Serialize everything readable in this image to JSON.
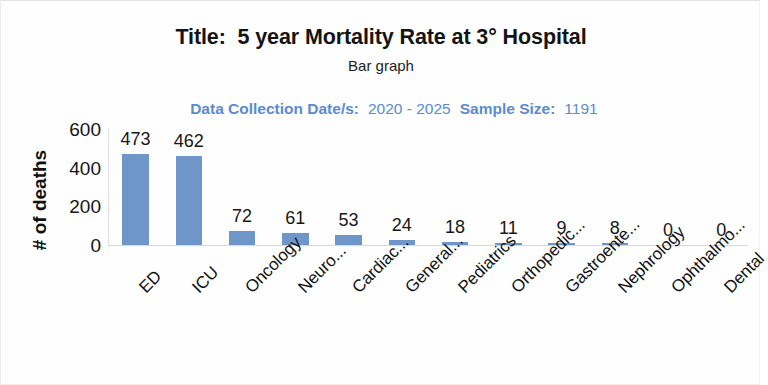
{
  "header": {
    "title": "Title:  5 year Mortality Rate at 3° Hospital",
    "subtitle": "Bar graph",
    "data_collection_label": "Data Collection Date/s:",
    "data_collection_value": "2020 - 2025",
    "sample_size_label": "Sample Size:",
    "sample_size_value": "1191",
    "meta_color": "#5b8bd0"
  },
  "chart_data": {
    "type": "bar",
    "title": "Title:  5 year Mortality Rate at 3° Hospital",
    "subtitle": "Bar graph",
    "xlabel": "",
    "ylabel": "# of deaths",
    "ylim": [
      0,
      600
    ],
    "yticks": [
      600,
      400,
      200,
      0
    ],
    "grid": false,
    "legend": false,
    "bar_color": "#6f96c8",
    "categories": [
      "ED",
      "ICU",
      "Oncology",
      "Neuro...",
      "Cardiac...",
      "General...",
      "Pediatrics",
      "Orthopedic...",
      "Gastroente...",
      "Nephrology",
      "Ophthalmo...",
      "Dental"
    ],
    "values": [
      473,
      462,
      72,
      61,
      53,
      24,
      18,
      11,
      9,
      8,
      0,
      0
    ],
    "data_labels": [
      "473",
      "462",
      "72",
      "61",
      "53",
      "24",
      "18",
      "11",
      "9",
      "8",
      "0",
      "0"
    ]
  }
}
